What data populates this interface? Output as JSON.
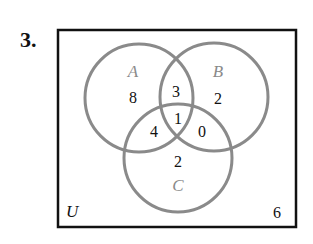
{
  "problem_number": "3.",
  "universe": {
    "label": "U",
    "outside_count": "6"
  },
  "colors": {
    "circle_stroke": "#8a8a8a",
    "set_label": "#8a8a8a",
    "text": "#111111",
    "box_stroke": "#111111"
  },
  "sets": [
    {
      "id": "A",
      "label": "A"
    },
    {
      "id": "B",
      "label": "B"
    },
    {
      "id": "C",
      "label": "C"
    }
  ],
  "regions": {
    "A_only": "8",
    "B_only": "2",
    "C_only": "2",
    "A_and_B_only": "3",
    "A_and_C_only": "4",
    "B_and_C_only": "0",
    "A_and_B_and_C": "1",
    "none": "6"
  }
}
